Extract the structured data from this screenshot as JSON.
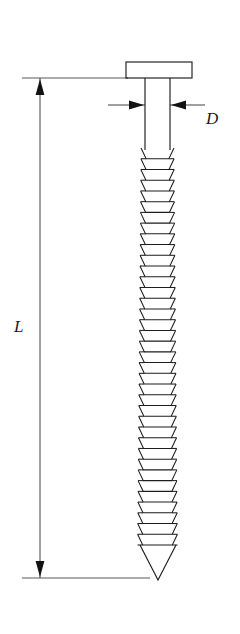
{
  "figure": {
    "kind": "engineering-dimension-drawing",
    "background_color": "#ffffff",
    "line_color": "#1d1d1d",
    "dimension_color": "#2a2a2a",
    "labels": {
      "length": "L",
      "diameter": "D"
    },
    "geometry": {
      "head": {
        "x": 126,
        "y": 62,
        "width": 66,
        "height": 16
      },
      "shank": {
        "left": 145,
        "right": 170,
        "top": 78,
        "thread_start_y": 148
      },
      "tip": {
        "apex_x": 158,
        "apex_y": 580
      },
      "thread": {
        "count": 37,
        "pitch": 11.7,
        "start_y": 148,
        "end_y": 545
      },
      "length_dimension": {
        "x": 40,
        "top_y": 78,
        "bottom_y": 578
      },
      "diameter_dimension": {
        "y": 105,
        "left_x": 108,
        "right_x": 205
      },
      "top_extension": {
        "y": 78,
        "x1": 22,
        "x2": 128
      },
      "bottom_extension": {
        "y": 578,
        "x1": 22,
        "x2": 150
      }
    }
  }
}
